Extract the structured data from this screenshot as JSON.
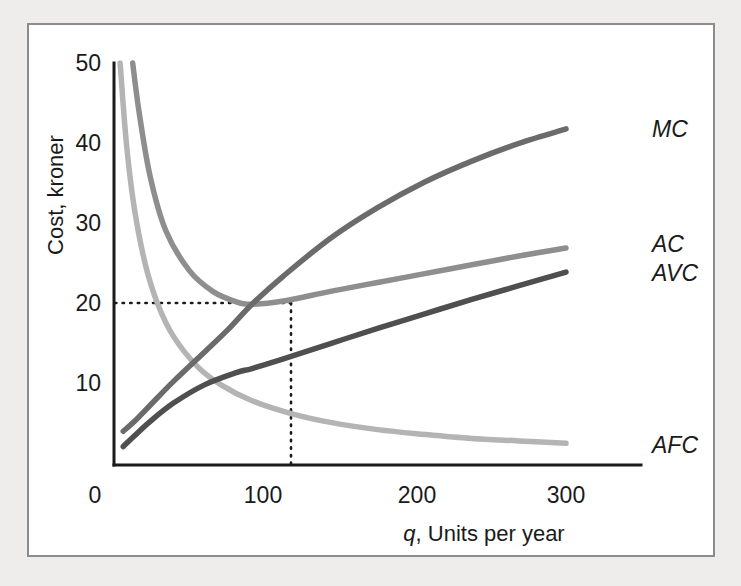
{
  "figure": {
    "background_color": "#eeedeb",
    "panel_color": "#ffffff",
    "border_color": "#8a8d8f"
  },
  "chart_data": {
    "type": "line",
    "title": "",
    "subtitle": "",
    "xlabel": "q, Units per year",
    "xlabel_italic_prefix": "q",
    "xlabel_rest": ", Units per year",
    "ylabel": "Cost, kroner",
    "xlim": [
      0,
      320
    ],
    "ylim": [
      0,
      52
    ],
    "xticks": [
      0,
      100,
      200,
      300
    ],
    "xtick_labels": [
      "0",
      "100",
      "200",
      "300"
    ],
    "yticks": [
      10,
      20,
      30,
      40,
      50
    ],
    "ytick_labels": [
      "10",
      "20",
      "30",
      "40",
      "50"
    ],
    "grid": false,
    "legend_position": "right-of-curve-ends",
    "annotations": [
      {
        "name": "minimum-ac-guide",
        "type": "dotted-crosshair",
        "x": 100,
        "y": 20,
        "description": "Dotted lines mark minimum AC at q=100, cost=20 kroner where MC crosses AC"
      }
    ],
    "series": [
      {
        "name": "MC",
        "label": "MC",
        "color": "#6b6b6b",
        "description": "Marginal cost, U-shaped rising curve crossing AVC and AC minimums",
        "x": [
          18,
          25,
          35,
          50,
          70,
          85,
          100,
          120,
          150,
          180,
          210,
          240,
          270,
          300
        ],
        "y": [
          4.2,
          5.4,
          7.4,
          10.4,
          14.1,
          16.9,
          20.0,
          23.5,
          28.2,
          32.0,
          35.2,
          37.8,
          40.0,
          41.8
        ]
      },
      {
        "name": "AC",
        "label": "AC",
        "color": "#8e8e8e",
        "description": "Average total cost, U-shaped with minimum 20 kroner at q=100",
        "x": [
          24,
          28,
          35,
          45,
          60,
          75,
          90,
          100,
          120,
          150,
          180,
          210,
          240,
          270,
          300
        ],
        "y": [
          50.0,
          44.0,
          36.0,
          29.2,
          24.2,
          21.6,
          20.3,
          20.0,
          20.4,
          21.6,
          22.7,
          23.8,
          24.9,
          26.0,
          27.0
        ]
      },
      {
        "name": "AVC",
        "label": "AVC",
        "color": "#4f4f4f",
        "description": "Average variable cost, rising curve approaching AC from below",
        "x": [
          18,
          25,
          35,
          50,
          70,
          90,
          100,
          120,
          150,
          180,
          210,
          240,
          270,
          300
        ],
        "y": [
          2.3,
          3.6,
          5.4,
          7.7,
          10.0,
          11.5,
          12.0,
          13.2,
          15.1,
          17.0,
          18.8,
          20.6,
          22.3,
          24.0
        ]
      },
      {
        "name": "AFC",
        "label": "AFC",
        "color": "#b4b4b4",
        "description": "Average fixed cost, rectangular hyperbola falling toward zero",
        "x": [
          16,
          20,
          25,
          32,
          40,
          50,
          65,
          80,
          100,
          125,
          150,
          180,
          210,
          240,
          270,
          300
        ],
        "y": [
          50.0,
          40.0,
          32.0,
          25.0,
          20.0,
          16.0,
          12.3,
          10.0,
          8.0,
          6.4,
          5.3,
          4.4,
          3.8,
          3.3,
          3.0,
          2.7
        ]
      }
    ]
  }
}
